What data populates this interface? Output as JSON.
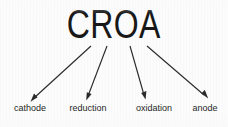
{
  "diagram": {
    "type": "mnemonic-acronym-diagram",
    "background_color": "#fcfcfc",
    "ink_color": "#1f1f1f",
    "title": "CROA",
    "title_letters": [
      "C",
      "R",
      "O",
      "A"
    ],
    "labels": [
      {
        "id": "cathode",
        "text": "cathode",
        "letter": "C"
      },
      {
        "id": "reduction",
        "text": "reduction",
        "letter": "R"
      },
      {
        "id": "oxidation",
        "text": "oxidation",
        "letter": "O"
      },
      {
        "id": "anode",
        "text": "anode",
        "letter": "A"
      }
    ],
    "arrows": [
      {
        "id": "arrow-c-to-cathode",
        "from": "C",
        "to": "cathode",
        "direction": "down-left"
      },
      {
        "id": "arrow-r-to-reduction",
        "from": "R",
        "to": "reduction",
        "direction": "down"
      },
      {
        "id": "arrow-o-to-oxidation",
        "from": "O",
        "to": "oxidation",
        "direction": "down-right"
      },
      {
        "id": "arrow-a-to-anode",
        "from": "A",
        "to": "anode",
        "direction": "down-right"
      }
    ]
  }
}
